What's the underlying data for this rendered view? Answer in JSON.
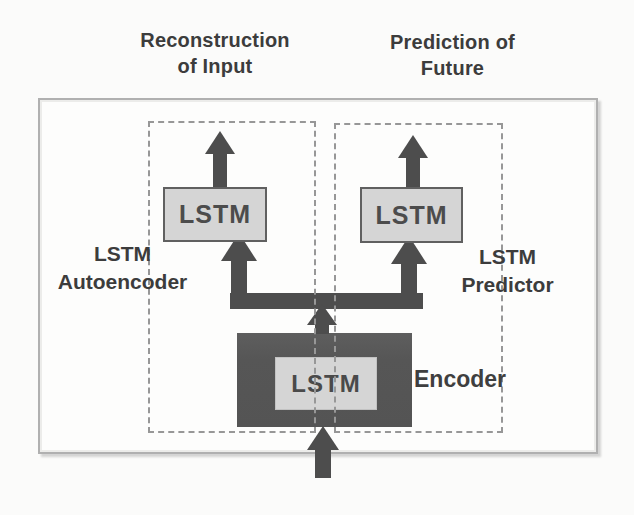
{
  "titles": {
    "reconstruction": {
      "line1": "Reconstruction",
      "line2": "of Input"
    },
    "prediction": {
      "line1": "Prediction of",
      "line2": "Future"
    }
  },
  "labels": {
    "autoencoder": {
      "line1": "LSTM",
      "line2": "Autoencoder"
    },
    "predictor": {
      "line1": "LSTM",
      "line2": "Predictor"
    },
    "encoder": "Encoder"
  },
  "boxes": {
    "left_lstm": "LSTM",
    "right_lstm": "LSTM",
    "encoder_lstm": "LSTM"
  },
  "colors": {
    "arrow": "#4d4d4d",
    "encoder_fill": "#565656",
    "lstm_fill": "#d5d5d5",
    "lstm_border": "#606060",
    "outer_border": "#b0b0b0",
    "dashed_border": "#979797",
    "text": "#3c3c3c",
    "canvas_bg": "#fbfbfa"
  }
}
